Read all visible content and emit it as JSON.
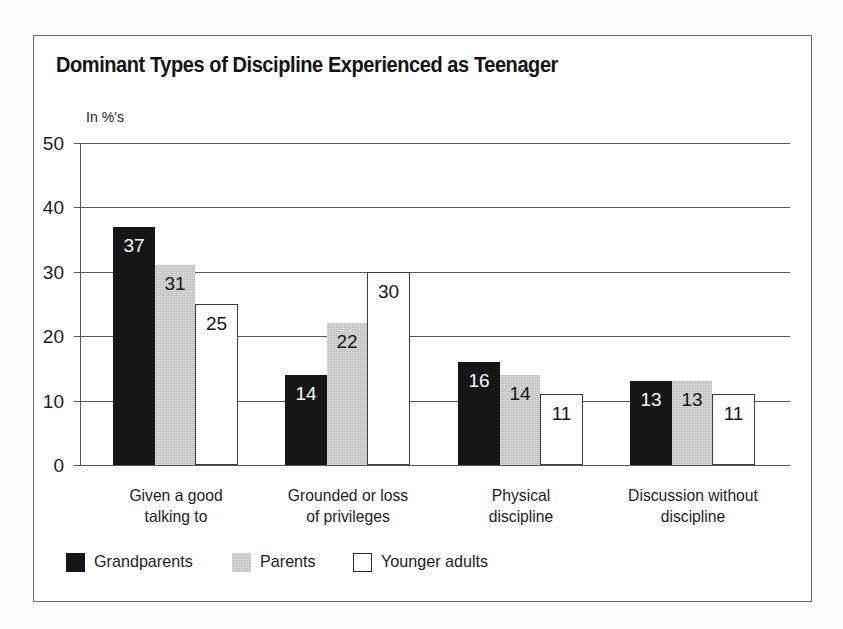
{
  "chart_data": {
    "type": "bar",
    "title": "Dominant Types of Discipline Experienced as Teenager",
    "ylabel": "In %'s",
    "xlabel": "",
    "ylim": [
      0,
      50
    ],
    "yticks": [
      0,
      10,
      20,
      30,
      40,
      50
    ],
    "ytick_labels": [
      "0",
      "10",
      "20",
      "30",
      "40",
      "50"
    ],
    "grid": true,
    "legend_position": "bottom-left",
    "categories": [
      "Given a good\ntalking to",
      "Grounded or loss\nof privileges",
      "Physical\ndiscipline",
      "Discussion without\ndiscipline"
    ],
    "category_lines": [
      [
        "Given a good",
        "talking to"
      ],
      [
        "Grounded or loss",
        "of privileges"
      ],
      [
        "Physical",
        "discipline"
      ],
      [
        "Discussion without",
        "discipline"
      ]
    ],
    "series": [
      {
        "name": "Grandparents",
        "color": "#161616",
        "values": [
          37,
          14,
          16,
          13
        ]
      },
      {
        "name": "Parents",
        "color": "#bcbcbc",
        "values": [
          31,
          22,
          14,
          13
        ]
      },
      {
        "name": "Younger adults",
        "color": "#ffffff",
        "values": [
          25,
          30,
          11,
          11
        ]
      }
    ],
    "data_labels": [
      [
        "37",
        "31",
        "25"
      ],
      [
        "14",
        "22",
        "30"
      ],
      [
        "16",
        "14",
        "11"
      ],
      [
        "13",
        "13",
        "11"
      ]
    ]
  },
  "legend": {
    "items": [
      {
        "label": "Grandparents",
        "swatch": "black-swatch"
      },
      {
        "label": "Parents",
        "swatch": "gray-swatch"
      },
      {
        "label": "Younger adults",
        "swatch": "white-swatch"
      }
    ]
  }
}
